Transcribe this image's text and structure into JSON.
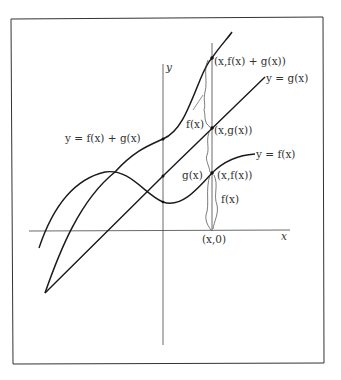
{
  "figure": {
    "colors": {
      "ink": "#1a1a1a",
      "frame": "#333333",
      "background": "#ffffff"
    },
    "axes": {
      "x_label": "x",
      "y_label": "y"
    },
    "curves": [
      {
        "name": "sum",
        "label": "y = f(x) + g(x)"
      },
      {
        "name": "g",
        "label": "y = g(x)"
      },
      {
        "name": "f",
        "label": "y = f(x)"
      }
    ],
    "points": {
      "sum_point": "(x,f(x) + g(x))",
      "g_point": "(x,g(x))",
      "f_point": "(x,f(x))",
      "x_point": "(x,0)"
    },
    "braces": {
      "upper_brace": "f(x)",
      "middle_brace": "g(x)",
      "lower_brace": "f(x)"
    }
  }
}
